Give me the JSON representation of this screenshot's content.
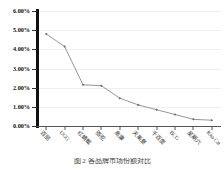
{
  "chart_data": {
    "type": "line",
    "title": "",
    "subtitle": "",
    "xlabel": "",
    "ylabel": "",
    "ylim": [
      0,
      6
    ],
    "ytick_labels": [
      "6.00%",
      "5.00%",
      "4.00%",
      "3.00%",
      "2.00%",
      "1.00%",
      "0.00%"
    ],
    "ytick_values": [
      6,
      5,
      4,
      3,
      2,
      1,
      0
    ],
    "grid": true,
    "legend": null,
    "legend_position": "none",
    "categories": [
      "百丽",
      "UGG",
      "红蜻蜓",
      "骆驼",
      "奥康",
      "天美意",
      "千百度",
      "BCG",
      "星期六",
      "Kiss Cat"
    ],
    "values": [
      4.8,
      4.15,
      2.15,
      2.1,
      1.45,
      1.1,
      0.85,
      0.6,
      0.35,
      0.3
    ],
    "value_labels": [
      "4.80%",
      "4.15%",
      "2.15%",
      "2.10%",
      "1.45%",
      "1.10%",
      "0.85%",
      "0.60%",
      "0.35%",
      "0.30%"
    ],
    "marker": "diamond",
    "line_color": "#8a8a8a",
    "marker_color": "#6e6e6e",
    "axis_color": "#111111",
    "grid_color": "#efefef"
  },
  "caption": {
    "text": "图 2 各品牌市场份额对比",
    "figure_number": "图 2"
  }
}
